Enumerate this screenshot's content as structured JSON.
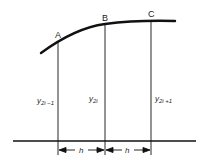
{
  "diagram": {
    "points": [
      {
        "label": "A",
        "x": 58,
        "ordinate": "y2i-1",
        "sub": "2i−1"
      },
      {
        "label": "B",
        "x": 105,
        "ordinate": "y2i",
        "sub": "2i"
      },
      {
        "label": "C",
        "x": 151,
        "ordinate": "y2i+1",
        "sub": "2i+1"
      }
    ],
    "labels": {
      "A": "A",
      "B": "B",
      "C": "C",
      "y": "y",
      "sub1": "2i −1",
      "sub2": "2i",
      "sub3": "2i +1",
      "h1": "h",
      "h2": "h"
    }
  }
}
